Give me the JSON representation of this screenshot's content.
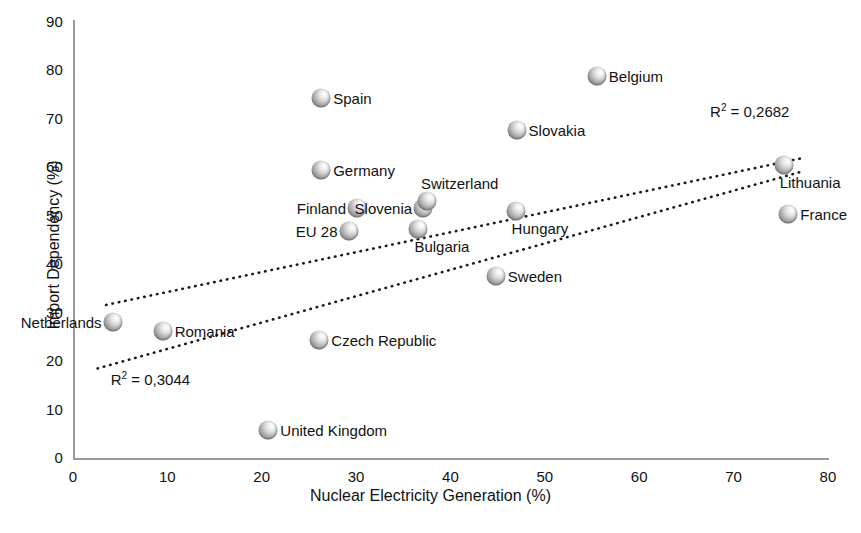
{
  "chart_data": {
    "type": "scatter",
    "title": "",
    "xlabel": "Nuclear Electricity Generation (%)",
    "ylabel": "Import Dependency (%)",
    "xlim": [
      0,
      80
    ],
    "ylim": [
      0,
      90
    ],
    "xticks": [
      "0",
      "10",
      "20",
      "30",
      "40",
      "50",
      "60",
      "70",
      "80"
    ],
    "yticks": [
      "0",
      "10",
      "20",
      "30",
      "40",
      "50",
      "60",
      "70",
      "80",
      "90"
    ],
    "grid": false,
    "legend": "none",
    "marker_style": "sphere-gradient",
    "points": [
      {
        "label": "Netherlands",
        "x": 4.2,
        "y": 28.1,
        "label_side": "left"
      },
      {
        "label": "Romania",
        "x": 9.5,
        "y": 26.3,
        "label_side": "right"
      },
      {
        "label": "United Kingdom",
        "x": 20.7,
        "y": 5.7,
        "label_side": "right"
      },
      {
        "label": "Czech Republic",
        "x": 26.1,
        "y": 24.3,
        "label_side": "right"
      },
      {
        "label": "Spain",
        "x": 26.3,
        "y": 74.3,
        "label_side": "right"
      },
      {
        "label": "Germany",
        "x": 26.3,
        "y": 59.4,
        "label_side": "right"
      },
      {
        "label": "EU 28",
        "x": 29.2,
        "y": 46.8,
        "label_side": "left"
      },
      {
        "label": "Finland",
        "x": 30.1,
        "y": 51.6,
        "label_side": "left"
      },
      {
        "label": "Bulgaria",
        "x": 36.6,
        "y": 47.3,
        "label_side": "below"
      },
      {
        "label": "Slovenia",
        "x": 37.1,
        "y": 51.7,
        "label_side": "left"
      },
      {
        "label": "Switzerland",
        "x": 37.5,
        "y": 53.0,
        "label_side": "above"
      },
      {
        "label": "Sweden",
        "x": 44.8,
        "y": 37.5,
        "label_side": "right"
      },
      {
        "label": "Hungary",
        "x": 46.9,
        "y": 51.0,
        "label_side": "below"
      },
      {
        "label": "Slovakia",
        "x": 47.0,
        "y": 67.8,
        "label_side": "right"
      },
      {
        "label": "Belgium",
        "x": 55.5,
        "y": 78.8,
        "label_side": "right"
      },
      {
        "label": "Lithuania",
        "x": 75.3,
        "y": 60.5,
        "label_side": "below"
      },
      {
        "label": "France",
        "x": 75.8,
        "y": 50.3,
        "label_side": "right"
      }
    ],
    "trendlines": [
      {
        "name": "upper-trendline",
        "r2_text": "R² = 0,2682",
        "r2_value": 0.2682,
        "style": "dotted",
        "x_start": 3.5,
        "y_start": 31.6,
        "x_end": 77.5,
        "y_end": 62.0
      },
      {
        "name": "lower-trendline",
        "r2_text": "R² = 0,3044",
        "r2_value": 0.3044,
        "style": "dotted",
        "x_start": 2.6,
        "y_start": 18.5,
        "x_end": 77.0,
        "y_end": 59.0
      }
    ],
    "annotations": [
      {
        "name": "r2-upper",
        "text": "R² = 0,2682",
        "x": 67.5,
        "y": 71.5
      },
      {
        "name": "r2-lower",
        "text": "R² = 0,3044",
        "x": 4.0,
        "y": 16.0
      }
    ]
  }
}
